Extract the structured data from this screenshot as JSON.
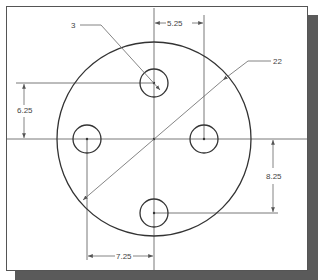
{
  "drawing": {
    "colors": {
      "outline": "#333333",
      "thin": "#666666",
      "frame": "#555555",
      "shadow": "#5a5a5a",
      "background": "#ffffff"
    },
    "plate": {
      "shape": "circle",
      "center": [
        154,
        139
      ],
      "radius": 97
    },
    "holes": [
      {
        "name": "top",
        "center": [
          154,
          83
        ],
        "radius": 14
      },
      {
        "name": "left",
        "center": [
          87,
          139
        ],
        "radius": 14
      },
      {
        "name": "right",
        "center": [
          204,
          139
        ],
        "radius": 14
      },
      {
        "name": "bottom",
        "center": [
          154,
          213
        ],
        "radius": 14
      }
    ],
    "dimensions": {
      "hole_diameter": "3",
      "plate_diameter": "22",
      "top_right_horizontal": "5.25",
      "left_vertical": "6.25",
      "right_vertical": "8.25",
      "bottom_horizontal": "7.25"
    }
  }
}
